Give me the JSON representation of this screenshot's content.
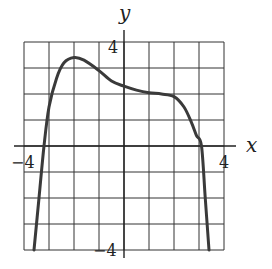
{
  "chart_data": {
    "type": "line",
    "title": "",
    "xlabel": "x",
    "ylabel": "y",
    "xlim": [
      -4,
      4
    ],
    "ylim": [
      -4,
      4
    ],
    "grid": true,
    "grid_step": 1,
    "tick_labels": {
      "x": [
        "-4",
        "4"
      ],
      "y": [
        "4",
        "-4"
      ]
    },
    "series": [
      {
        "name": "curve",
        "x": [
          -3.6,
          -3.4,
          -3.2,
          -3.0,
          -2.7,
          -2.4,
          -2.0,
          -1.6,
          -1.0,
          -0.5,
          0.0,
          0.5,
          1.0,
          1.5,
          2.0,
          2.4,
          2.7,
          2.9,
          3.1,
          3.25,
          3.4
        ],
        "y": [
          -4.0,
          -2.0,
          0.0,
          1.5,
          2.6,
          3.2,
          3.4,
          3.3,
          2.9,
          2.5,
          2.3,
          2.15,
          2.05,
          2.0,
          1.9,
          1.5,
          0.9,
          0.4,
          0.0,
          -2.0,
          -4.0
        ]
      }
    ]
  },
  "labels": {
    "x_axis": "x",
    "y_axis": "y",
    "x_min": "−4",
    "x_max": "4",
    "y_max": "4",
    "y_min": "−4"
  },
  "colors": {
    "grid": "#333333",
    "curve": "#3a3a3a"
  }
}
